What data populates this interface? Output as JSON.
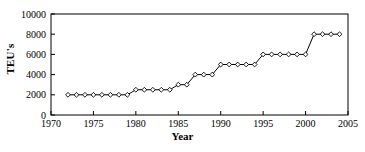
{
  "chart_data": {
    "type": "line",
    "title": "",
    "xlabel": "Year",
    "ylabel": "TEU's",
    "xlim": [
      1970,
      2005
    ],
    "ylim": [
      0,
      10000
    ],
    "xticks": [
      1970,
      1975,
      1980,
      1985,
      1990,
      1995,
      2000,
      2005
    ],
    "xtick_labels": [
      "1970",
      "1975",
      "1980",
      "1985",
      "1990",
      "1995",
      "2000",
      "2005"
    ],
    "yticks": [
      0,
      2000,
      4000,
      6000,
      8000,
      10000
    ],
    "ytick_labels": [
      "0",
      "2000",
      "4000",
      "6000",
      "8000",
      "10000"
    ],
    "grid": false,
    "legend": null,
    "marker": "open-diamond",
    "line_color": "#000000",
    "marker_face_color": "#ffffff",
    "marker_edge_color": "#000000",
    "x": [
      1972,
      1973,
      1974,
      1975,
      1976,
      1977,
      1978,
      1979,
      1980,
      1981,
      1982,
      1983,
      1984,
      1985,
      1986,
      1987,
      1988,
      1989,
      1990,
      1991,
      1992,
      1993,
      1994,
      1995,
      1996,
      1997,
      1998,
      1999,
      2000,
      2001,
      2002,
      2003,
      2004
    ],
    "values": [
      2000,
      2000,
      2000,
      2000,
      2000,
      2000,
      2000,
      2000,
      2500,
      2500,
      2500,
      2500,
      2500,
      3000,
      3000,
      4000,
      4000,
      4000,
      5000,
      5000,
      5000,
      5000,
      5000,
      6000,
      6000,
      6000,
      6000,
      6000,
      6000,
      8000,
      8000,
      8000,
      8000
    ]
  },
  "axes": {
    "ylabel_text": "TEU's",
    "xlabel_text": "Year"
  }
}
